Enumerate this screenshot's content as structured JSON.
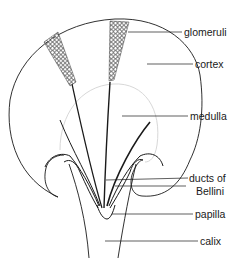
{
  "figure": {
    "type": "anatomical diagram"
  },
  "labels": {
    "glomeruli": "glomeruli",
    "cortex": "cortex",
    "medulla": "medulla",
    "ducts_line1": "ducts of",
    "ducts_line2": "Bellini",
    "papilla": "papilla",
    "calix": "calix"
  },
  "colors": {
    "ink": "#1a1a1a",
    "faint": "#d8d8d8",
    "background": "#ffffff"
  }
}
